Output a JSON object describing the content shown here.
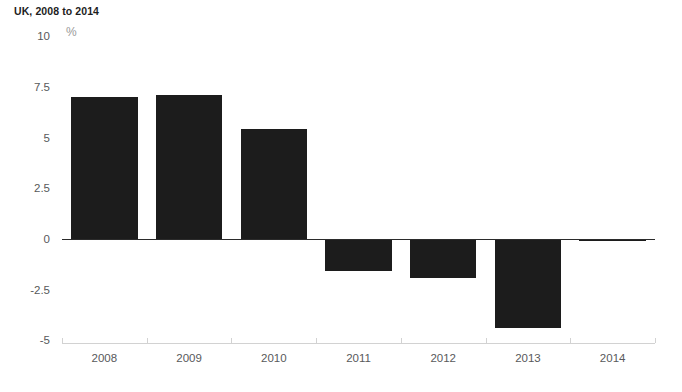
{
  "header": {
    "title": "UK, 2008 to 2014"
  },
  "chart_data": {
    "type": "bar",
    "title": "UK, 2008 to 2014",
    "subtitle": "",
    "xlabel": "",
    "ylabel": "",
    "unit_label": "%",
    "categories": [
      "2008",
      "2009",
      "2010",
      "2011",
      "2012",
      "2013",
      "2014"
    ],
    "values": [
      7.0,
      7.1,
      5.4,
      -1.6,
      -1.9,
      -4.4,
      0.0
    ],
    "series": [
      {
        "name": "",
        "values": [
          7.0,
          7.1,
          5.4,
          -1.6,
          -1.9,
          -4.4,
          0.0
        ]
      }
    ],
    "ylim": [
      -5,
      10
    ],
    "yticks": [
      10,
      7.5,
      5,
      2.5,
      0,
      -2.5,
      -5
    ],
    "ytick_labels": [
      "10",
      "7.5",
      "5",
      "2.5",
      "0",
      "-2.5",
      "-5"
    ],
    "grid": false,
    "legend": "none",
    "bar_color": "#1c1c1c",
    "axis_color": "#d2d2d2",
    "zero_line_color": "#2b2b2b",
    "tick_label_color": "#58595b",
    "background": "#ffffff"
  }
}
